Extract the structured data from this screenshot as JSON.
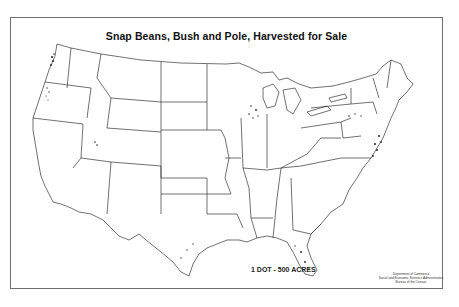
{
  "map": {
    "title": "Snap Beans, Bush and Pole, Harvested for Sale",
    "legend": "1 DOT - 500 ACRES",
    "credit": [
      "Department of Commerce",
      "Social and Economic Statistics Administration",
      "Bureau of the Census"
    ],
    "region": "Contiguous United States",
    "map_type": "dot density",
    "dot_value_acres": 500,
    "colors": {
      "outline": "#333333",
      "dots": "#222222",
      "background": "#ffffff"
    },
    "concentration_areas": [
      "Western Washington",
      "Willamette Valley, Oregon",
      "Northern Utah",
      "Wisconsin",
      "Michigan",
      "Western New York",
      "Pennsylvania",
      "New Jersey",
      "Delmarva / Maryland",
      "Eastern Virginia & North Carolina",
      "Florida",
      "Gulf Coast (Texas, Louisiana)",
      "Tennessee"
    ]
  }
}
